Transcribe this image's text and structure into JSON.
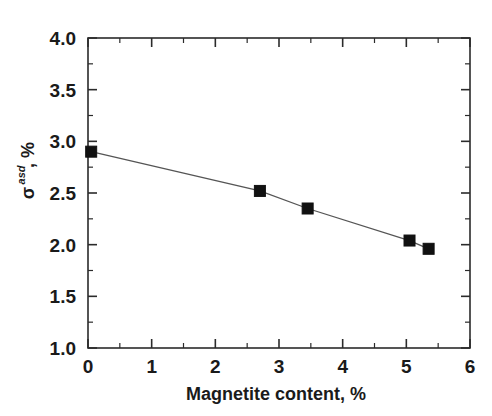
{
  "chart_data": {
    "type": "line",
    "title": "",
    "subtitle": "",
    "xlabel": "Magnetite content, %",
    "ylabel": "σasd, %",
    "ylabel_parts": {
      "symbol": "σ",
      "subscript": "asd",
      "suffix": ", %"
    },
    "xlim": [
      0,
      6
    ],
    "ylim": [
      1.0,
      4.0
    ],
    "x_ticks": [
      0,
      1,
      2,
      3,
      4,
      5,
      6
    ],
    "x_tick_labels": [
      "0",
      "1",
      "2",
      "3",
      "4",
      "5",
      "6"
    ],
    "x_minor_ticks": [
      0.5,
      1.5,
      2.5,
      3.5,
      4.5,
      5.5
    ],
    "y_ticks": [
      1.0,
      1.5,
      2.0,
      2.5,
      3.0,
      3.5,
      4.0
    ],
    "y_tick_labels": [
      "1.0",
      "1.5",
      "2.0",
      "2.5",
      "3.0",
      "3.5",
      "4.0"
    ],
    "y_minor_ticks": [
      1.25,
      1.75,
      2.25,
      2.75,
      3.25,
      3.75
    ],
    "grid": false,
    "legend": false,
    "legend_position": "none",
    "marker_style": "filled-square",
    "marker_color": "#111111",
    "line_color": "#555555",
    "frame_color": "#2b2b2b",
    "background_color": "#ffffff",
    "x": [
      0.05,
      2.7,
      3.45,
      5.05,
      5.35
    ],
    "values": [
      2.9,
      2.52,
      2.35,
      2.04,
      1.96
    ],
    "series": [
      {
        "name": "sigma_asd",
        "points": [
          {
            "x": 0.05,
            "y": 2.9
          },
          {
            "x": 2.7,
            "y": 2.52
          },
          {
            "x": 3.45,
            "y": 2.35
          },
          {
            "x": 5.05,
            "y": 2.04
          },
          {
            "x": 5.35,
            "y": 1.96
          }
        ]
      }
    ]
  }
}
